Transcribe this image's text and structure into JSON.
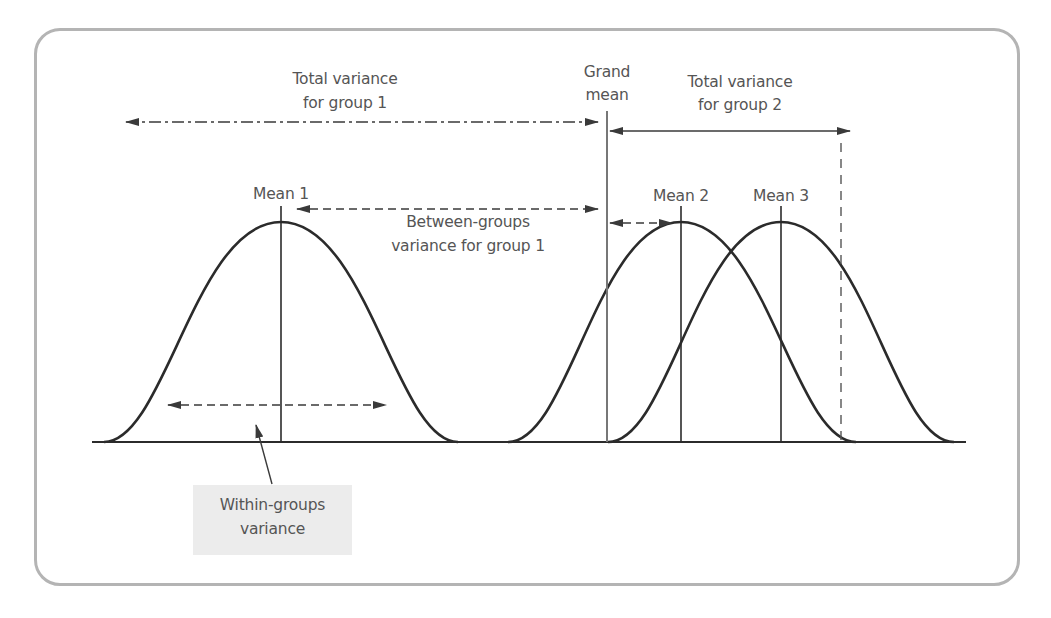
{
  "diagram": {
    "labels": {
      "total_var_g1_line1": "Total variance",
      "total_var_g1_line2": "for group 1",
      "grand_mean_line1": "Grand",
      "grand_mean_line2": "mean",
      "total_var_g2_line1": "Total variance",
      "total_var_g2_line2": "for group 2",
      "mean1": "Mean 1",
      "mean2": "Mean 2",
      "mean3": "Mean 3",
      "between_line1": "Between-groups",
      "between_line2": "variance for group 1",
      "within_line1": "Within-groups",
      "within_line2": "variance"
    },
    "colors": {
      "curve": "#2b2b2b",
      "text": "#555555",
      "frame": "#b4b4b4",
      "callout_bg": "#ececec"
    },
    "distributions": [
      {
        "name": "Group 1",
        "mean_x": 281,
        "label": "Mean 1"
      },
      {
        "name": "Group 2",
        "mean_x": 681,
        "label": "Mean 2"
      },
      {
        "name": "Group 3",
        "mean_x": 781,
        "label": "Mean 3"
      }
    ],
    "grand_mean_x": 607
  }
}
